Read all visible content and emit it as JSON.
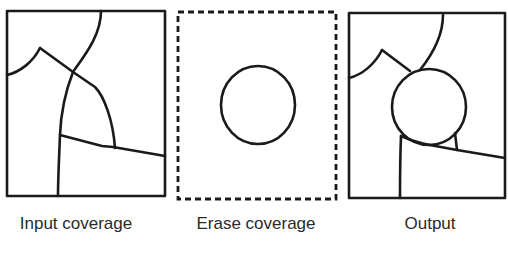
{
  "panels": [
    {
      "id": "input",
      "caption": "Input coverage",
      "caption_x": 76,
      "box": {
        "x": 7,
        "y": 11,
        "w": 158,
        "h": 185,
        "style": "solid"
      },
      "paths": [
        "M7,75 C20,72 33,62 40,48",
        "M40,48 L73,72 L95,87 C104,96 113,120 115,148",
        "M101,11 C101,35 85,55 73,72 C66,90 61,110 60,135 C59,160 58,180 58,196",
        "M60,135 L102,146 L113,147 L165,156"
      ]
    },
    {
      "id": "erase",
      "caption": "Erase coverage",
      "caption_x": 256,
      "box": {
        "x": 178,
        "y": 12,
        "w": 158,
        "h": 187,
        "style": "dashed"
      },
      "circle": {
        "cx": 258,
        "cy": 105,
        "rx": 37,
        "ry": 39
      }
    },
    {
      "id": "output",
      "caption": "Output",
      "caption_x": 430,
      "box": {
        "x": 349,
        "y": 13,
        "w": 156,
        "h": 185,
        "style": "solid"
      },
      "paths": [
        "M349,78 C362,75 375,64 382,50",
        "M382,50 L410,71",
        "M443,15 C443,37 432,55 420,70",
        "M401,136 C400,160 400,180 400,198",
        "M401,136 L420,143",
        "M455,133 L457,150",
        "M434,146 L455,150 L505,158"
      ],
      "circle": {
        "cx": 429,
        "cy": 107,
        "rx": 37,
        "ry": 38
      }
    }
  ],
  "style": {
    "stroke": "#1a1a1a",
    "stroke_width": 2.6
  }
}
